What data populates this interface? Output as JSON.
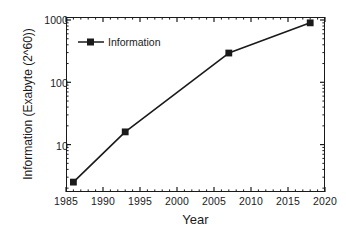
{
  "chart_data": {
    "type": "line",
    "title": "",
    "xlabel": "Year",
    "ylabel": "Information (Exabyte (2^60))",
    "xlim": [
      1985,
      2020
    ],
    "ylim": [
      2,
      1000
    ],
    "yscale": "log",
    "xscale": "linear",
    "grid": false,
    "legend_position": "upper-left",
    "x_ticks": [
      "1985",
      "1990",
      "1995",
      "2000",
      "2005",
      "2010",
      "2015",
      "2020"
    ],
    "x_tick_values": [
      1985,
      1990,
      1995,
      2000,
      2005,
      2010,
      2015,
      2020
    ],
    "y_ticks": [
      "10",
      "100",
      "1000"
    ],
    "y_tick_values": [
      10,
      100,
      1000
    ],
    "minor_ticks": true,
    "series": [
      {
        "name": "Information",
        "marker": "square",
        "color": "#1a1a1a",
        "x": [
          1986,
          1993,
          2007,
          2018
        ],
        "values": [
          2.5,
          16,
          295,
          900
        ]
      }
    ]
  },
  "legend": {
    "entries": [
      {
        "label": "Information",
        "marker": "square-marker",
        "color": "#1a1a1a"
      }
    ]
  },
  "axes": {
    "x_title": "Year",
    "y_title": "Information (Exabyte (2^60))"
  },
  "colors": {
    "line": "#1a1a1a",
    "marker": "#1a1a1a",
    "axis": "#1a1a1a",
    "background": "#ffffff"
  }
}
